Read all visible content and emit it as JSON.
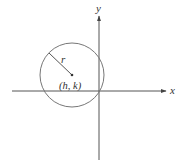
{
  "diagram": {
    "axes": {
      "x_label": "x",
      "y_label": "y",
      "origin": [
        99,
        91
      ]
    },
    "circle": {
      "center_label": "(h, k)",
      "radius_label": "r",
      "center": [
        72,
        75
      ],
      "radius": 32
    },
    "colors": {
      "stroke": "#555555",
      "axis": "#444444",
      "background": "#ffffff"
    }
  }
}
